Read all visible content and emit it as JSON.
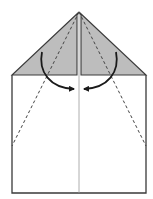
{
  "diagram": {
    "title": "",
    "colors": {
      "background": "#ffffff",
      "flap_fill": "#bdbdbd",
      "outline": "#3a3a3a",
      "center_line": "#9a9a9a",
      "fold_line": "#444444",
      "arrow": "#1a1a1a"
    },
    "paper": {
      "left": 12,
      "right": 146,
      "top_shoulder": 75,
      "bottom": 193,
      "apex_x": 79,
      "apex_y": 12
    },
    "elements": [
      {
        "type": "shaded-flap",
        "side": "left"
      },
      {
        "type": "shaded-flap",
        "side": "right"
      },
      {
        "type": "center-crease"
      },
      {
        "type": "valley-fold-dashed",
        "side": "left"
      },
      {
        "type": "valley-fold-dashed",
        "side": "right"
      },
      {
        "type": "fold-arrow",
        "side": "left",
        "direction": "toward-center"
      },
      {
        "type": "fold-arrow",
        "side": "right",
        "direction": "toward-center"
      }
    ]
  }
}
